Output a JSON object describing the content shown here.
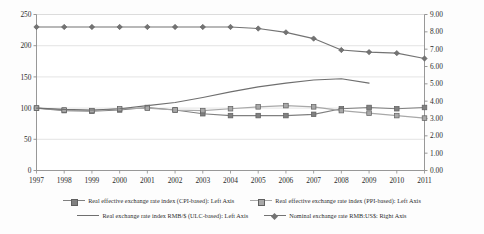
{
  "chart_data": {
    "type": "line",
    "title": "",
    "subtitle": "",
    "xlabel": "",
    "ylabel": "",
    "y2label": "",
    "grid": true,
    "legend_position": "bottom",
    "x": [
      "1997",
      "1998",
      "1999",
      "2000",
      "2001",
      "2002",
      "2003",
      "2004",
      "2005",
      "2006",
      "2007",
      "2008",
      "2009",
      "2010",
      "2011"
    ],
    "categories": [
      "1997",
      "1998",
      "1999",
      "2000",
      "2001",
      "2002",
      "2003",
      "2004",
      "2005",
      "2006",
      "2007",
      "2008",
      "2009",
      "2010",
      "2011"
    ],
    "left_axis": {
      "min": 0,
      "max": 250,
      "step": 50,
      "ticks": [
        "0",
        "50",
        "100",
        "150",
        "200",
        "250"
      ]
    },
    "right_axis": {
      "min": 0,
      "max": 9,
      "step": 1,
      "ticks": [
        "0.00",
        "1.00",
        "2.00",
        "3.00",
        "4.00",
        "5.00",
        "6.00",
        "7.00",
        "8.00",
        "9.00"
      ]
    },
    "series": [
      {
        "name": "Real effective exchange rate index (CPI-based): Left Axis",
        "short_name": "reer-cpi",
        "axis": "left",
        "marker": "square",
        "color": "#808080",
        "values": [
          100,
          96,
          95,
          97,
          101,
          97,
          91,
          88,
          88,
          88,
          90,
          99,
          101,
          99,
          101
        ]
      },
      {
        "name": "Real effective exchange rate index (PPI-based): Left Axis",
        "short_name": "reer-ppi",
        "axis": "left",
        "marker": "square",
        "color": "#a8a8a8",
        "values": [
          100,
          97,
          96,
          99,
          100,
          97,
          96,
          99,
          102,
          104,
          102,
          96,
          92,
          88,
          84
        ]
      },
      {
        "name": "Real exchange rate index RMB/$ (ULC-based): Left Axis",
        "short_name": "rer-ulc",
        "axis": "left",
        "marker": "none",
        "color": "#6f6f6f",
        "values": [
          100,
          98,
          97,
          99,
          104,
          109,
          117,
          126,
          134,
          140,
          145,
          147,
          140,
          null,
          null
        ]
      },
      {
        "name": "Nominal exchange rate RMB:US$: Right Axis",
        "short_name": "ner-rmb-usd",
        "axis": "right",
        "marker": "diamond",
        "color": "#737373",
        "values": [
          8.28,
          8.28,
          8.28,
          8.28,
          8.28,
          8.28,
          8.28,
          8.28,
          8.19,
          7.97,
          7.61,
          6.95,
          6.83,
          6.77,
          6.46
        ]
      }
    ]
  },
  "legend": {
    "row1": [
      {
        "label": "Real effective exchange rate index (CPI-based): Left Axis",
        "marker": "square",
        "color": "#808080"
      },
      {
        "label": "Real effective exchange rate index (PPI-based): Left Axis",
        "marker": "square",
        "color": "#a8a8a8"
      }
    ],
    "row2": [
      {
        "label": "Real exchange rate index RMB/$ (ULC-based): Left Axis",
        "marker": "none",
        "color": "#6f6f6f"
      },
      {
        "label": "Nominal exchange rate RMB:US$: Right Axis",
        "marker": "diamond",
        "color": "#737373"
      }
    ]
  },
  "colors": {
    "background": "#fdfdfd",
    "axis": "#8c8c8c",
    "grid": "#d9d9d9",
    "text": "#2b2b2b"
  }
}
